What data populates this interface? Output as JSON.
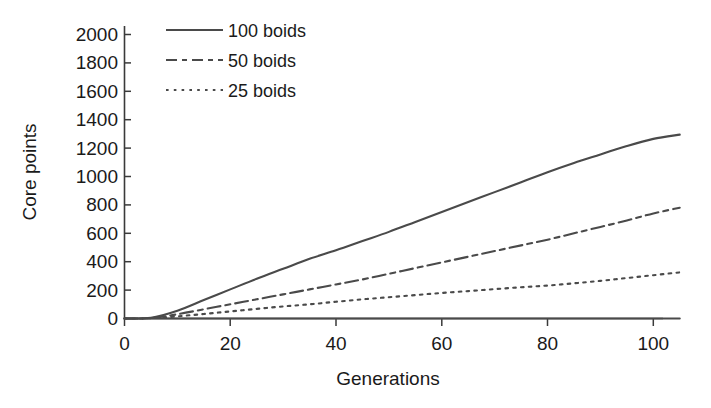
{
  "chart_data": {
    "type": "line",
    "title": "",
    "subtitle": "",
    "xlabel": "Generations",
    "ylabel": "Core points",
    "xlim": [
      0,
      105
    ],
    "ylim": [
      0,
      2000
    ],
    "xticks": [
      0,
      20,
      40,
      60,
      80,
      100
    ],
    "yticks": [
      0,
      200,
      400,
      600,
      800,
      1000,
      1200,
      1400,
      1600,
      1800,
      2000
    ],
    "xtick_labels": [
      "0",
      "20",
      "40",
      "60",
      "80",
      "100"
    ],
    "ytick_labels": [
      "0",
      "200",
      "400",
      "600",
      "800",
      "1000",
      "1200",
      "1400",
      "1600",
      "1800",
      "2000"
    ],
    "grid": false,
    "legend_position": "top-left-inside",
    "line_color": "#4a4a4a",
    "x": [
      0,
      5,
      10,
      15,
      20,
      25,
      30,
      35,
      40,
      45,
      50,
      55,
      60,
      65,
      70,
      75,
      80,
      85,
      90,
      95,
      100,
      105
    ],
    "series": [
      {
        "name": "100 boids",
        "style": "solid",
        "values": [
          0,
          5,
          55,
          130,
          205,
          280,
          350,
          420,
          480,
          545,
          610,
          680,
          750,
          820,
          890,
          960,
          1030,
          1095,
          1155,
          1215,
          1265,
          1295
        ]
      },
      {
        "name": "50 boids",
        "style": "dash-dot",
        "values": [
          0,
          3,
          30,
          65,
          100,
          135,
          170,
          205,
          240,
          275,
          315,
          355,
          395,
          435,
          475,
          515,
          555,
          600,
          645,
          690,
          740,
          780
        ]
      },
      {
        "name": "25 boids",
        "style": "dotted",
        "values": [
          0,
          2,
          15,
          32,
          50,
          68,
          85,
          100,
          118,
          135,
          150,
          165,
          180,
          193,
          207,
          220,
          232,
          248,
          265,
          285,
          305,
          325
        ]
      },
      {
        "name": "baseline",
        "style": "solid-flat",
        "values": [
          0,
          0,
          0,
          0,
          0,
          0,
          0,
          0,
          0,
          0,
          0,
          0,
          0,
          0,
          0,
          0,
          0,
          0,
          0,
          0,
          0,
          0
        ]
      }
    ]
  },
  "legend": {
    "entries": [
      {
        "label": "100 boids",
        "style": "solid"
      },
      {
        "label": "50 boids",
        "style": "dash-dot"
      },
      {
        "label": "25 boids",
        "style": "dotted"
      }
    ]
  },
  "axes": {
    "x_title": "Generations",
    "y_title": "Core points"
  }
}
